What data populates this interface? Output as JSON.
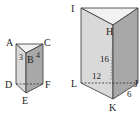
{
  "figure": {
    "left_prism": {
      "vertices": {
        "A": "A",
        "B": "B",
        "C": "C",
        "D": "D",
        "E": "E",
        "F": "F"
      },
      "edge_labels": {
        "AB": "3",
        "BC": "4"
      }
    },
    "right_prism": {
      "vertices": {
        "I": "I",
        "G": "G",
        "H": "H",
        "L": "L",
        "J": "J",
        "K": "K"
      },
      "edge_labels": {
        "height": "16",
        "LJ": "12",
        "KJ": "6"
      }
    },
    "colors": {
      "top_face": "#f2f2f2",
      "left_face": "#d9d9d9",
      "right_face": "#a8a8a8",
      "edge": "#333333"
    }
  }
}
